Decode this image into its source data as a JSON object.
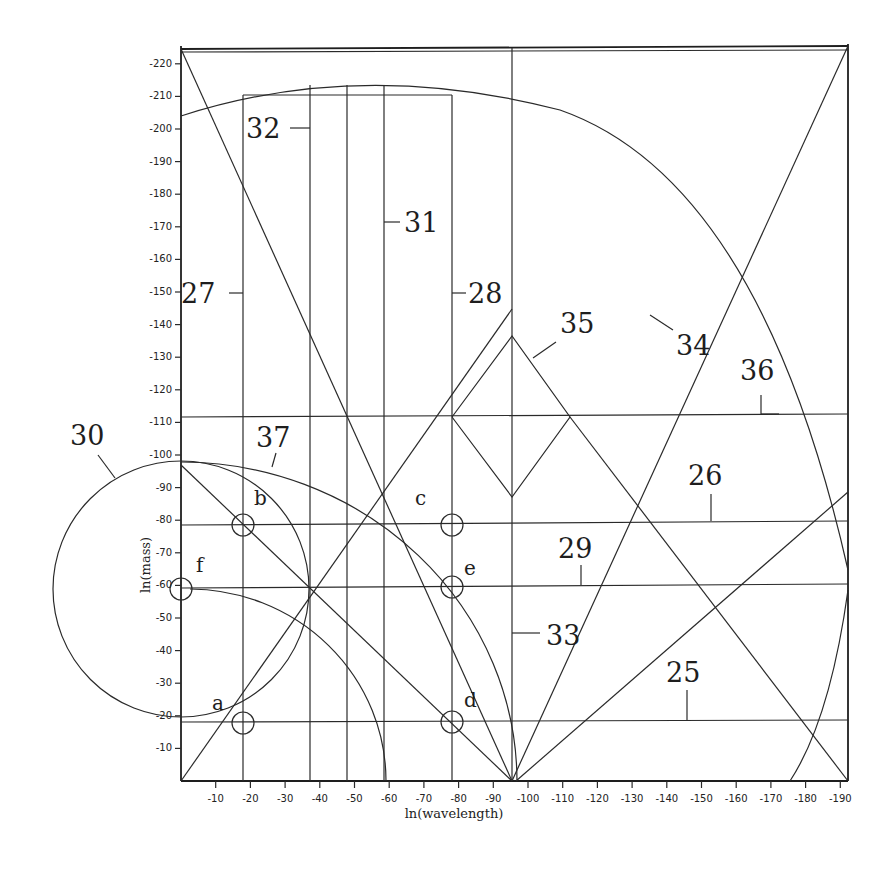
{
  "chart_data": {
    "type": "diagram",
    "title": "",
    "xlabel": "ln(wavelength)",
    "ylabel": "ln(mass)",
    "x_ticks": [
      "-10",
      "-20",
      "-30",
      "-40",
      "-50",
      "-60",
      "-70",
      "-80",
      "-90",
      "-100",
      "-110",
      "-120",
      "-130",
      "-140",
      "-150",
      "-160",
      "-170",
      "-180",
      "-190"
    ],
    "y_ticks": [
      "-10",
      "-20",
      "-30",
      "-40",
      "-50",
      "-60",
      "-70",
      "-80",
      "-90",
      "-100",
      "-110",
      "-120",
      "-130",
      "-140",
      "-150",
      "-160",
      "-170",
      "-180",
      "-190",
      "-200",
      "-210",
      "-220"
    ],
    "xlim": [
      0,
      -192
    ],
    "ylim": [
      0,
      -222
    ],
    "grid": false,
    "line_labels": [
      {
        "id": "25",
        "kind": "horizontal",
        "ln_mass": -18
      },
      {
        "id": "26",
        "kind": "horizontal",
        "ln_mass": -79
      },
      {
        "id": "27",
        "kind": "vertical",
        "ln_wavelength": -18
      },
      {
        "id": "28",
        "kind": "vertical",
        "ln_wavelength": -78
      },
      {
        "id": "29",
        "kind": "horizontal",
        "ln_mass": -60
      },
      {
        "id": "30",
        "kind": "circle",
        "center": [
          0,
          -60
        ],
        "radius": 39
      },
      {
        "id": "31",
        "kind": "vertical",
        "ln_wavelength": -59
      },
      {
        "id": "32",
        "kind": "vertical",
        "ln_wavelength": -37
      },
      {
        "id": "33",
        "kind": "vertical",
        "ln_wavelength": -96
      },
      {
        "id": "34",
        "kind": "diagonal",
        "from": [
          -96,
          0
        ],
        "to": [
          -192,
          -222
        ]
      },
      {
        "id": "35",
        "kind": "zigzag",
        "peak": [
          -96,
          -136
        ],
        "trough": [
          -96,
          -87
        ]
      },
      {
        "id": "36",
        "kind": "horizontal",
        "ln_mass": -111
      },
      {
        "id": "37",
        "kind": "arc",
        "center": [
          0,
          0
        ],
        "radius": 98
      }
    ],
    "points": [
      {
        "id": "a",
        "ln_wavelength": -18,
        "ln_mass": -18
      },
      {
        "id": "b",
        "ln_wavelength": -18,
        "ln_mass": -79
      },
      {
        "id": "c",
        "ln_wavelength": -78,
        "ln_mass": -79
      },
      {
        "id": "d",
        "ln_wavelength": -78,
        "ln_mass": -18
      },
      {
        "id": "e",
        "ln_wavelength": -78,
        "ln_mass": -60
      },
      {
        "id": "f",
        "ln_wavelength": 0,
        "ln_mass": -60
      }
    ]
  },
  "labels": {
    "n25": "25",
    "n26": "26",
    "n27": "27",
    "n28": "28",
    "n29": "29",
    "n30": "30",
    "n31": "31",
    "n32": "32",
    "n33": "33",
    "n34": "34",
    "n35": "35",
    "n36": "36",
    "n37": "37",
    "pa": "a",
    "pb": "b",
    "pc": "c",
    "pd": "d",
    "pe": "e",
    "pf": "f"
  },
  "axes": {
    "x_title": "ln(wavelength)",
    "y_title": "ln(mass)",
    "x_ticks": [
      "-10",
      "-20",
      "-30",
      "-40",
      "-50",
      "-60",
      "-70",
      "-80",
      "-90",
      "-100",
      "-110",
      "-120",
      "-130",
      "-140",
      "-150",
      "-160",
      "-170",
      "-180",
      "-190"
    ],
    "y_ticks": [
      "-10",
      "-20",
      "-30",
      "-40",
      "-50",
      "-60",
      "-70",
      "-80",
      "-90",
      "-100",
      "-110",
      "-120",
      "-130",
      "-140",
      "-150",
      "-160",
      "-170",
      "-180",
      "-190",
      "-200",
      "-210",
      "-220"
    ]
  }
}
